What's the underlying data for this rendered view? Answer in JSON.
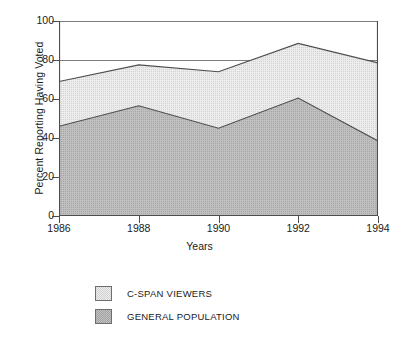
{
  "chart_data": {
    "type": "area",
    "stacked": true,
    "title": "",
    "xlabel": "Years",
    "ylabel": "Percent Reporting Having Voted",
    "categories": [
      1986,
      1988,
      1990,
      1992,
      1994
    ],
    "xtick_labels": [
      "1986",
      "1988",
      "1990",
      "1992",
      "1994"
    ],
    "ytick_labels": [
      "0",
      "20",
      "40",
      "60",
      "80",
      "100"
    ],
    "ytick_values": [
      0,
      20,
      40,
      60,
      80,
      100
    ],
    "ylim": [
      0,
      100
    ],
    "xlim": [
      1986,
      1994
    ],
    "grid": "horizontal-top-only",
    "legend_position": "below-center",
    "series": [
      {
        "name": "C-SPAN VIEWERS",
        "color": "#e3e3e3",
        "line_color": "#4d4d4d",
        "values": [
          69,
          77.5,
          74,
          88.5,
          78.5
        ]
      },
      {
        "name": "GENERAL POPULATION",
        "color": "#b5b5b5",
        "line_color": "#4d4d4d",
        "values": [
          46,
          56.5,
          45,
          60.5,
          38.5
        ]
      }
    ]
  },
  "axis": {
    "y_title": "Percent Reporting Having Voted",
    "x_title": "Years"
  },
  "legend": {
    "items": [
      {
        "label": "C-SPAN VIEWERS",
        "swatch_color": "#e3e3e3"
      },
      {
        "label": "GENERAL POPULATION",
        "swatch_color": "#b5b5b5"
      }
    ]
  },
  "colors": {
    "cspan_fill": "#e3e3e3",
    "general_fill": "#b5b5b5",
    "line": "#4d4d4d",
    "axis": "#4d4d4d",
    "text": "#1a1a1a",
    "background": "#ffffff"
  }
}
